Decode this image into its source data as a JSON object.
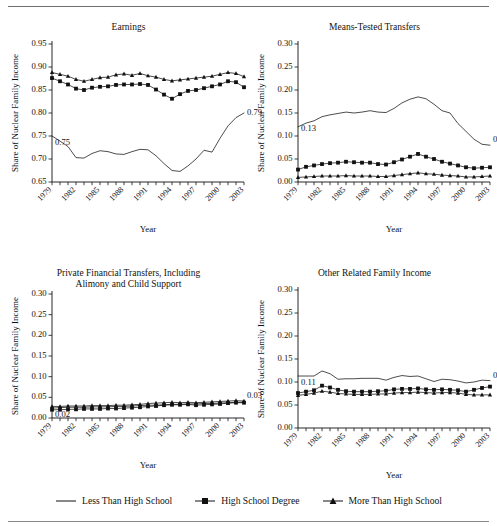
{
  "figure": {
    "top_partial_text": "",
    "x_axis_label": "Year",
    "y_axis_label": "Share of Nuclear Family Income",
    "x_tick_labels": [
      "1979",
      "1982",
      "1985",
      "1988",
      "1991",
      "1994",
      "1997",
      "2000",
      "2003"
    ],
    "years_all": [
      1979,
      1980,
      1981,
      1982,
      1983,
      1984,
      1985,
      1986,
      1987,
      1988,
      1989,
      1990,
      1991,
      1992,
      1993,
      1994,
      1995,
      1996,
      1997,
      1998,
      1999,
      2000,
      2001,
      2002,
      2003
    ]
  },
  "legend": {
    "items": [
      {
        "label": "Less Than High School",
        "marker": "line"
      },
      {
        "label": "High School Degree",
        "marker": "square"
      },
      {
        "label": "More Than High School",
        "marker": "triangle"
      }
    ]
  },
  "chart_data": [
    {
      "type": "line",
      "panel": "earnings",
      "title": "Earnings",
      "title_line2": "",
      "xlabel": "Year",
      "ylabel": "Share of Nuclear Family Income",
      "ylim": [
        0.65,
        0.95
      ],
      "yticks": [
        0.65,
        0.7,
        0.75,
        0.8,
        0.85,
        0.9,
        0.95
      ],
      "ytick_labels": [
        "0.65",
        "0.70",
        "0.75",
        "0.80",
        "0.85",
        "0.90",
        "0.95"
      ],
      "xlim": [
        1979,
        2003
      ],
      "grid": false,
      "annotations": [
        {
          "text": "0.75",
          "x": 1979,
          "y": 0.75,
          "place": "start"
        },
        {
          "text": "0.79",
          "x": 2003,
          "y": 0.79,
          "place": "end"
        }
      ],
      "x": [
        1979,
        1980,
        1981,
        1982,
        1983,
        1984,
        1985,
        1986,
        1987,
        1988,
        1989,
        1990,
        1991,
        1992,
        1993,
        1994,
        1995,
        1996,
        1997,
        1998,
        1999,
        2000,
        2001,
        2002,
        2003
      ],
      "series": [
        {
          "name": "Less Than High School",
          "marker": "line",
          "values": [
            0.75,
            0.739,
            0.727,
            0.703,
            0.702,
            0.712,
            0.718,
            0.716,
            0.711,
            0.71,
            0.716,
            0.721,
            0.72,
            0.707,
            0.69,
            0.675,
            0.673,
            0.685,
            0.7,
            0.719,
            0.715,
            0.745,
            0.772,
            0.79,
            0.8,
            0.795
          ]
        },
        {
          "name": "High School Degree",
          "marker": "square",
          "values": [
            0.876,
            0.869,
            0.862,
            0.853,
            0.85,
            0.855,
            0.857,
            0.858,
            0.861,
            0.862,
            0.862,
            0.863,
            0.861,
            0.851,
            0.84,
            0.831,
            0.841,
            0.848,
            0.85,
            0.854,
            0.858,
            0.862,
            0.869,
            0.867,
            0.856
          ]
        },
        {
          "name": "More Than High School",
          "marker": "triangle",
          "values": [
            0.888,
            0.884,
            0.88,
            0.873,
            0.869,
            0.873,
            0.877,
            0.878,
            0.883,
            0.885,
            0.882,
            0.886,
            0.881,
            0.878,
            0.873,
            0.87,
            0.872,
            0.874,
            0.876,
            0.878,
            0.88,
            0.884,
            0.888,
            0.886,
            0.879
          ]
        }
      ]
    },
    {
      "type": "line",
      "panel": "means-tested-transfers",
      "title": "Means-Tested Transfers",
      "title_line2": "",
      "xlabel": "Year",
      "ylabel": "Share of Nuclear Family Income",
      "ylim": [
        0.0,
        0.3
      ],
      "yticks": [
        0.0,
        0.05,
        0.1,
        0.15,
        0.2,
        0.25,
        0.3
      ],
      "ytick_labels": [
        "0.00",
        "0.05",
        "0.10",
        "0.15",
        "0.20",
        "0.25",
        "0.30"
      ],
      "xlim": [
        1979,
        2003
      ],
      "grid": false,
      "annotations": [
        {
          "text": "0.13",
          "x": 1979,
          "y": 0.13,
          "place": "start"
        },
        {
          "text": "0.08",
          "x": 2003,
          "y": 0.08,
          "place": "end"
        }
      ],
      "x": [
        1979,
        1980,
        1981,
        1982,
        1983,
        1984,
        1985,
        1986,
        1987,
        1988,
        1989,
        1990,
        1991,
        1992,
        1993,
        1994,
        1995,
        1996,
        1997,
        1998,
        1999,
        2000,
        2001,
        2002,
        2003
      ],
      "series": [
        {
          "name": "Less Than High School",
          "marker": "line",
          "values": [
            0.12,
            0.128,
            0.133,
            0.142,
            0.146,
            0.149,
            0.152,
            0.15,
            0.152,
            0.155,
            0.152,
            0.151,
            0.16,
            0.172,
            0.18,
            0.185,
            0.181,
            0.169,
            0.155,
            0.15,
            0.127,
            0.11,
            0.093,
            0.082,
            0.08,
            0.084
          ]
        },
        {
          "name": "High School Degree",
          "marker": "square",
          "values": [
            0.027,
            0.033,
            0.036,
            0.039,
            0.041,
            0.042,
            0.044,
            0.043,
            0.042,
            0.042,
            0.039,
            0.038,
            0.043,
            0.049,
            0.055,
            0.061,
            0.055,
            0.05,
            0.044,
            0.04,
            0.036,
            0.032,
            0.03,
            0.031,
            0.032
          ]
        },
        {
          "name": "More Than High School",
          "marker": "triangle",
          "values": [
            0.01,
            0.011,
            0.012,
            0.013,
            0.013,
            0.013,
            0.014,
            0.013,
            0.013,
            0.013,
            0.012,
            0.012,
            0.014,
            0.016,
            0.018,
            0.02,
            0.018,
            0.017,
            0.015,
            0.014,
            0.013,
            0.011,
            0.011,
            0.012,
            0.013
          ]
        }
      ]
    },
    {
      "type": "line",
      "panel": "private-financial-transfers",
      "title": "Private Financial Transfers, Including",
      "title_line2": "Alimony and Child Support",
      "xlabel": "Year",
      "ylabel": "Share of Nuclear Family Income",
      "ylim": [
        0.0,
        0.3
      ],
      "yticks": [
        0.0,
        0.05,
        0.1,
        0.15,
        0.2,
        0.25,
        0.3
      ],
      "ytick_labels": [
        "0.00",
        "0.05",
        "0.10",
        "0.15",
        "0.20",
        "0.25",
        "0.30"
      ],
      "xlim": [
        1979,
        2003
      ],
      "grid": false,
      "annotations": [
        {
          "text": "0.02",
          "x": 1979,
          "y": 0.024,
          "place": "start"
        },
        {
          "text": "0.03",
          "x": 2003,
          "y": 0.04,
          "place": "end"
        }
      ],
      "x": [
        1979,
        1980,
        1981,
        1982,
        1983,
        1984,
        1985,
        1986,
        1987,
        1988,
        1989,
        1990,
        1991,
        1992,
        1993,
        1994,
        1995,
        1996,
        1997,
        1998,
        1999,
        2000,
        2001,
        2002,
        2003
      ],
      "series": [
        {
          "name": "Less Than High School",
          "marker": "line",
          "values": [
            0.024,
            0.025,
            0.026,
            0.026,
            0.026,
            0.027,
            0.027,
            0.027,
            0.028,
            0.028,
            0.029,
            0.03,
            0.031,
            0.031,
            0.032,
            0.033,
            0.033,
            0.034,
            0.034,
            0.035,
            0.035,
            0.036,
            0.037,
            0.038,
            0.038
          ]
        },
        {
          "name": "High School Degree",
          "marker": "square",
          "values": [
            0.02,
            0.02,
            0.021,
            0.021,
            0.022,
            0.022,
            0.022,
            0.023,
            0.023,
            0.024,
            0.025,
            0.026,
            0.028,
            0.029,
            0.031,
            0.032,
            0.032,
            0.033,
            0.031,
            0.032,
            0.033,
            0.034,
            0.036,
            0.037,
            0.037
          ]
        },
        {
          "name": "More Than High School",
          "marker": "triangle",
          "values": [
            0.028,
            0.028,
            0.029,
            0.029,
            0.029,
            0.03,
            0.03,
            0.03,
            0.031,
            0.031,
            0.032,
            0.033,
            0.035,
            0.036,
            0.037,
            0.038,
            0.037,
            0.038,
            0.037,
            0.038,
            0.039,
            0.04,
            0.041,
            0.042,
            0.041
          ]
        }
      ]
    },
    {
      "type": "line",
      "panel": "other-related-family-income",
      "title": "Other Related Family Income",
      "title_line2": "",
      "xlabel": "Year",
      "ylabel": "Share of Nuclear Family Income",
      "ylim": [
        0.0,
        0.3
      ],
      "yticks": [
        0.0,
        0.05,
        0.1,
        0.15,
        0.2,
        0.25,
        0.3
      ],
      "ytick_labels": [
        "0.00",
        "0.05",
        "0.10",
        "0.15",
        "0.20",
        "0.25",
        "0.30"
      ],
      "xlim": [
        1979,
        2003
      ],
      "grid": false,
      "annotations": [
        {
          "text": "0.11",
          "x": 1979,
          "y": 0.113,
          "place": "start"
        },
        {
          "text": "0.10",
          "x": 2003,
          "y": 0.103,
          "place": "end"
        }
      ],
      "x": [
        1979,
        1980,
        1981,
        1982,
        1983,
        1984,
        1985,
        1986,
        1987,
        1988,
        1989,
        1990,
        1991,
        1992,
        1993,
        1994,
        1995,
        1996,
        1997,
        1998,
        1999,
        2000,
        2001,
        2002,
        2003
      ],
      "series": [
        {
          "name": "Less Than High School",
          "marker": "line",
          "values": [
            0.113,
            0.113,
            0.113,
            0.124,
            0.118,
            0.106,
            0.107,
            0.107,
            0.108,
            0.108,
            0.108,
            0.104,
            0.11,
            0.114,
            0.112,
            0.113,
            0.107,
            0.101,
            0.106,
            0.105,
            0.102,
            0.098,
            0.1,
            0.104,
            0.103
          ]
        },
        {
          "name": "High School Degree",
          "marker": "square",
          "values": [
            0.076,
            0.079,
            0.082,
            0.092,
            0.088,
            0.083,
            0.08,
            0.079,
            0.079,
            0.079,
            0.08,
            0.081,
            0.084,
            0.085,
            0.085,
            0.086,
            0.084,
            0.083,
            0.084,
            0.083,
            0.082,
            0.079,
            0.083,
            0.087,
            0.09
          ]
        },
        {
          "name": "More Than High School",
          "marker": "triangle",
          "values": [
            0.071,
            0.073,
            0.076,
            0.08,
            0.078,
            0.075,
            0.074,
            0.073,
            0.073,
            0.073,
            0.074,
            0.074,
            0.076,
            0.077,
            0.077,
            0.078,
            0.077,
            0.076,
            0.077,
            0.077,
            0.076,
            0.073,
            0.072,
            0.072,
            0.072
          ]
        }
      ]
    }
  ]
}
